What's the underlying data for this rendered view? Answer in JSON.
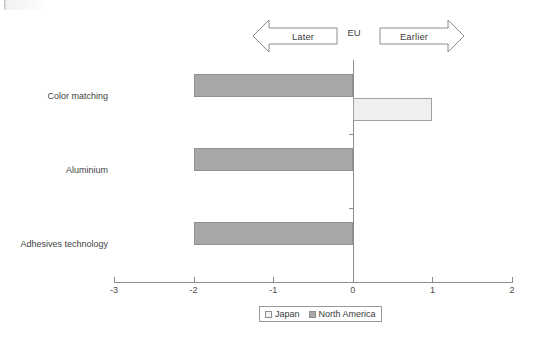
{
  "chart_data": {
    "type": "bar",
    "orientation": "horizontal",
    "title": "",
    "xlabel": "",
    "ylabel": "",
    "xlim": [
      -3,
      2
    ],
    "xticks": [
      -3,
      -2,
      -1,
      0,
      1,
      2
    ],
    "xtick_labels": [
      "-3",
      "-2",
      "-1",
      "0",
      "1",
      "2"
    ],
    "grid": false,
    "legend_position": "bottom-center",
    "categories": [
      "Color matching",
      "Aluminium",
      "Adhesives technology"
    ],
    "series": [
      {
        "name": "Japan",
        "color": "#efefef",
        "values": [
          1,
          0,
          0
        ]
      },
      {
        "name": "North America",
        "color": "#a8a8a8",
        "values": [
          -2,
          -2,
          -2
        ]
      }
    ],
    "annotations": {
      "left_arrow_label": "Later",
      "center_label": "EU",
      "right_arrow_label": "Earlier"
    }
  },
  "legend": {
    "items": [
      {
        "label": "Japan",
        "swatch": "jp"
      },
      {
        "label": "North America",
        "swatch": "na"
      }
    ]
  }
}
